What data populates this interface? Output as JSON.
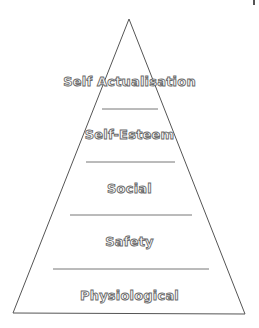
{
  "diagram": {
    "type": "pyramid",
    "title": "",
    "colors": {
      "outline": "#555555",
      "divider": "#777777",
      "label_stroke": "#6a6a6a",
      "label_fill": "#ffffff",
      "background": "#ffffff"
    },
    "levels": [
      {
        "label": "Self Actualisation",
        "order": 5
      },
      {
        "label": "Self-Esteem",
        "order": 4
      },
      {
        "label": "Social",
        "order": 3
      },
      {
        "label": "Safety",
        "order": 2
      },
      {
        "label": "Physiological",
        "order": 1
      }
    ]
  }
}
